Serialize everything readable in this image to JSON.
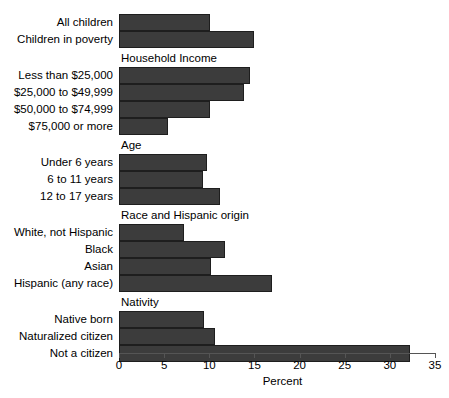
{
  "chart_data": {
    "type": "bar",
    "orientation": "horizontal",
    "title": "",
    "xlabel": "Percent",
    "ylabel": "",
    "xlim": [
      0,
      35
    ],
    "xticks": [
      0,
      5,
      10,
      15,
      20,
      25,
      30,
      35
    ],
    "xtick_labels": [
      "0",
      "5",
      "10",
      "15",
      "20",
      "25",
      "30",
      "35"
    ],
    "grid": false,
    "legend": false,
    "bar_color": "#3c3c3c",
    "background_color": "#ffffff",
    "groups": [
      {
        "header": "",
        "categories": [
          "All children",
          "Children in poverty"
        ],
        "values": [
          10.1,
          14.9
        ]
      },
      {
        "header": "Household Income",
        "categories": [
          "Less than $25,000",
          "$25,000 to $49,999",
          "$50,000 to $74,999",
          "$75,000 or more"
        ],
        "values": [
          14.5,
          13.9,
          10.1,
          5.4
        ]
      },
      {
        "header": "Age",
        "categories": [
          "Under 6 years",
          "6 to 11 years",
          "12 to 17 years"
        ],
        "values": [
          9.7,
          9.3,
          11.2
        ]
      },
      {
        "header": "Race and Hispanic origin",
        "categories": [
          "White, not Hispanic",
          "Black",
          "Asian",
          "Hispanic (any race)"
        ],
        "values": [
          7.2,
          11.7,
          10.2,
          16.9
        ]
      },
      {
        "header": "Nativity",
        "categories": [
          "Native born",
          "Naturalized citizen",
          "Not a citizen"
        ],
        "values": [
          9.4,
          10.6,
          32.2
        ]
      }
    ],
    "categories": [
      "All children",
      "Children in poverty",
      "Less than $25,000",
      "$25,000 to $49,999",
      "$50,000 to $74,999",
      "$75,000 or more",
      "Under 6 years",
      "6 to 11 years",
      "12 to 17 years",
      "White, not Hispanic",
      "Black",
      "Asian",
      "Hispanic (any race)",
      "Native born",
      "Naturalized citizen",
      "Not a citizen"
    ],
    "values": [
      10.1,
      14.9,
      14.5,
      13.9,
      10.1,
      5.4,
      9.7,
      9.3,
      11.2,
      7.2,
      11.7,
      10.2,
      16.9,
      9.4,
      10.6,
      32.2
    ]
  }
}
